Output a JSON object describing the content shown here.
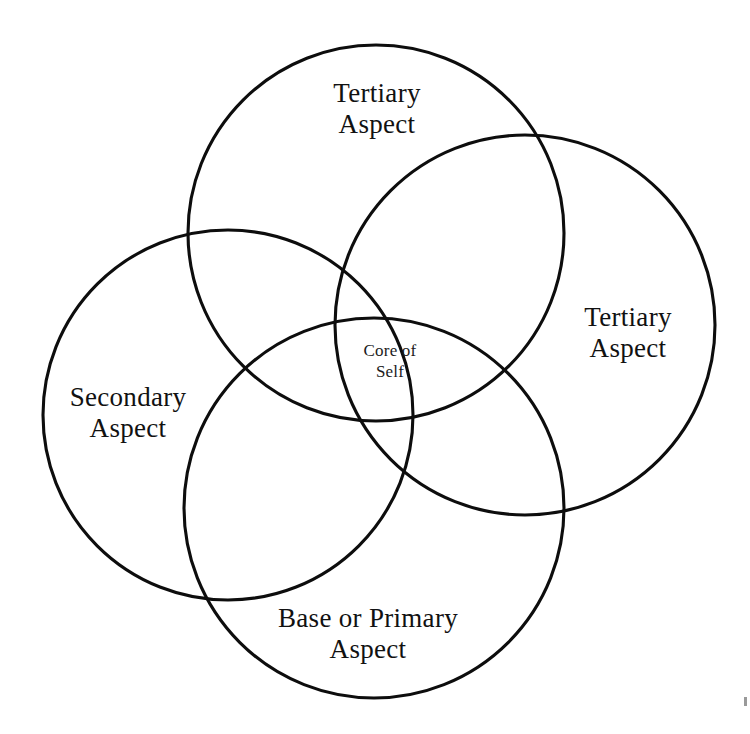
{
  "figure": {
    "type": "venn-diagram",
    "background_color": "#ffffff",
    "stroke_color": "#0d0d0d",
    "text_color": "#111111",
    "canvas": {
      "width": 750,
      "height": 734
    }
  },
  "labels": {
    "tertiary_top": {
      "line1": "Tertiary",
      "line2": "Aspect"
    },
    "tertiary_right": {
      "line1": "Tertiary",
      "line2": "Aspect"
    },
    "secondary_left": {
      "line1": "Secondary",
      "line2": "Aspect"
    },
    "base_primary_bottom": {
      "line1": "Base or Primary",
      "line2": "Aspect"
    },
    "core": {
      "line1": "Core of",
      "line2": "Self"
    }
  },
  "circles": [
    {
      "name": "tertiary-top-circle",
      "cx": 376,
      "cy": 233,
      "r": 188
    },
    {
      "name": "secondary-left-circle",
      "cx": 228,
      "cy": 415,
      "r": 185
    },
    {
      "name": "tertiary-right-circle",
      "cx": 525,
      "cy": 325,
      "r": 190
    },
    {
      "name": "base-primary-bottom-circle",
      "cx": 374,
      "cy": 508,
      "r": 190
    }
  ]
}
